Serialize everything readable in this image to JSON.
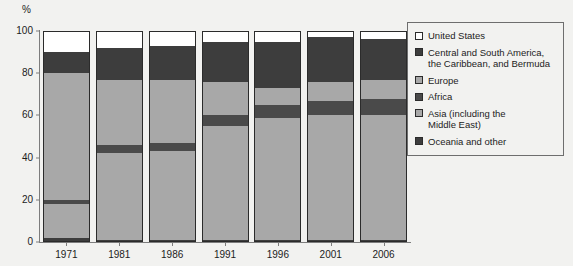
{
  "axis": {
    "y_unit": "%",
    "y_ticks": [
      "0",
      "20",
      "40",
      "60",
      "80",
      "100"
    ],
    "x_labels": [
      "1971",
      "1981",
      "1986",
      "1991",
      "1996",
      "2001",
      "2006"
    ]
  },
  "legend": {
    "items": [
      {
        "label": "United States",
        "color": "#ffffff"
      },
      {
        "label": "Central and South America,\nthe Caribbean, and Bermuda",
        "color": "#3d3d3d"
      },
      {
        "label": "Europe",
        "color": "#a8a8a8"
      },
      {
        "label": "Africa",
        "color": "#4a4a4a"
      },
      {
        "label": "Asia (including the\nMiddle East)",
        "color": "#a8a8a8"
      },
      {
        "label": "Oceania and other",
        "color": "#3d3d3d"
      }
    ]
  },
  "chart_data": {
    "type": "bar",
    "subtype": "stacked-bar-100",
    "title": "",
    "xlabel": "",
    "ylabel": "%",
    "ylim": [
      0,
      100
    ],
    "grid": false,
    "legend_position": "right",
    "categories": [
      "1971",
      "1981",
      "1986",
      "1991",
      "1996",
      "2001",
      "2006"
    ],
    "series": [
      {
        "name": "United States",
        "color": "#ffffff",
        "values": [
          10,
          8,
          7,
          5,
          5,
          3,
          4
        ]
      },
      {
        "name": "Central and South America, the Caribbean, and Bermuda",
        "color": "#3d3d3d",
        "values": [
          10,
          15,
          16,
          19,
          22,
          21,
          19
        ]
      },
      {
        "name": "Europe",
        "color": "#a8a8a8",
        "values": [
          60,
          31,
          30,
          16,
          8,
          9,
          9
        ]
      },
      {
        "name": "Africa",
        "color": "#4a4a4a",
        "values": [
          2,
          4,
          4,
          5,
          6,
          7,
          8
        ]
      },
      {
        "name": "Asia (including the Middle East)",
        "color": "#a8a8a8",
        "values": [
          16,
          41,
          42,
          54,
          58,
          59,
          59
        ]
      },
      {
        "name": "Oceania and other",
        "color": "#3d3d3d",
        "values": [
          2,
          1,
          1,
          1,
          1,
          1,
          1
        ]
      }
    ],
    "stack_order_bottom_to_top": [
      "Oceania and other",
      "Asia (including the Middle East)",
      "Africa",
      "Europe",
      "Central and South America, the Caribbean, and Bermuda",
      "United States"
    ]
  }
}
